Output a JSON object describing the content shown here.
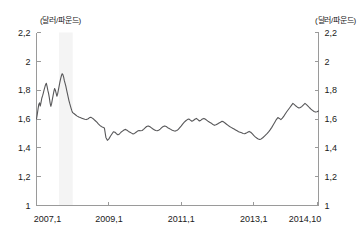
{
  "chart_data": {
    "type": "line",
    "title": "",
    "subtitle": "",
    "xlabel": "",
    "ylabel": "",
    "unit_label_left": "(달러/파운드)",
    "unit_label_right": "(달러/파운드)",
    "grid": false,
    "legend_position": "none",
    "ylim": [
      1,
      2.2
    ],
    "ytick_labels_left": [
      "2,2",
      "2",
      "1,8",
      "1,6",
      "1,4",
      "1,2",
      "1"
    ],
    "ytick_labels_right": [
      "2,2",
      "2",
      "1,8",
      "1,6",
      "1,4",
      "1,2",
      "1"
    ],
    "ytick_values": [
      2.2,
      2.0,
      1.8,
      1.6,
      1.4,
      1.2,
      1.0
    ],
    "xtick_labels": [
      "2007,1",
      "2009,1",
      "2011,1",
      "2013,1",
      "2014,10"
    ],
    "xtick_values": [
      2007.0,
      2009.0,
      2011.0,
      2013.0,
      2014.75
    ],
    "xlim": [
      2007.0,
      2014.79
    ],
    "series_color": "#58585a",
    "shaded_region": {
      "x_start": 2007.62,
      "x_end": 2008.0,
      "color": "#f4f4f4"
    },
    "x": [
      2007.0,
      2007.021,
      2007.042,
      2007.062,
      2007.083,
      2007.104,
      2007.125,
      2007.146,
      2007.167,
      2007.188,
      2007.208,
      2007.229,
      2007.25,
      2007.271,
      2007.292,
      2007.312,
      2007.333,
      2007.354,
      2007.375,
      2007.396,
      2007.417,
      2007.438,
      2007.458,
      2007.479,
      2007.5,
      2007.521,
      2007.542,
      2007.562,
      2007.583,
      2007.604,
      2007.625,
      2007.646,
      2007.667,
      2007.688,
      2007.708,
      2007.729,
      2007.75,
      2007.771,
      2007.792,
      2007.812,
      2007.833,
      2007.854,
      2007.875,
      2007.896,
      2007.917,
      2007.938,
      2007.958,
      2007.979,
      2008.0,
      2008.042,
      2008.083,
      2008.125,
      2008.167,
      2008.208,
      2008.25,
      2008.292,
      2008.333,
      2008.375,
      2008.417,
      2008.458,
      2008.5,
      2008.542,
      2008.583,
      2008.625,
      2008.667,
      2008.708,
      2008.75,
      2008.792,
      2008.833,
      2008.875,
      2008.917,
      2008.958,
      2009.0,
      2009.042,
      2009.083,
      2009.125,
      2009.167,
      2009.208,
      2009.25,
      2009.292,
      2009.333,
      2009.375,
      2009.417,
      2009.458,
      2009.5,
      2009.542,
      2009.583,
      2009.625,
      2009.667,
      2009.708,
      2009.75,
      2009.792,
      2009.833,
      2009.875,
      2009.917,
      2009.958,
      2010.0,
      2010.042,
      2010.083,
      2010.125,
      2010.167,
      2010.208,
      2010.25,
      2010.292,
      2010.333,
      2010.375,
      2010.417,
      2010.458,
      2010.5,
      2010.542,
      2010.583,
      2010.625,
      2010.667,
      2010.708,
      2010.75,
      2010.792,
      2010.833,
      2010.875,
      2010.917,
      2010.958,
      2011.0,
      2011.042,
      2011.083,
      2011.125,
      2011.167,
      2011.208,
      2011.25,
      2011.292,
      2011.333,
      2011.375,
      2011.417,
      2011.458,
      2011.5,
      2011.542,
      2011.583,
      2011.625,
      2011.667,
      2011.708,
      2011.75,
      2011.792,
      2011.833,
      2011.875,
      2011.917,
      2011.958,
      2012.0,
      2012.042,
      2012.083,
      2012.125,
      2012.167,
      2012.208,
      2012.25,
      2012.292,
      2012.333,
      2012.375,
      2012.417,
      2012.458,
      2012.5,
      2012.542,
      2012.583,
      2012.625,
      2012.667,
      2012.708,
      2012.75,
      2012.792,
      2012.833,
      2012.875,
      2012.917,
      2012.958,
      2013.0,
      2013.042,
      2013.083,
      2013.125,
      2013.167,
      2013.208,
      2013.25,
      2013.292,
      2013.333,
      2013.375,
      2013.417,
      2013.458,
      2013.5,
      2013.542,
      2013.583,
      2013.625,
      2013.667,
      2013.708,
      2013.75,
      2013.792,
      2013.833,
      2013.875,
      2013.917,
      2013.958,
      2014.0,
      2014.042,
      2014.083,
      2014.125,
      2014.167,
      2014.208,
      2014.25,
      2014.292,
      2014.333,
      2014.375,
      2014.417,
      2014.458,
      2014.5,
      2014.542,
      2014.583,
      2014.625,
      2014.667,
      2014.708,
      2014.75,
      2014.79
    ],
    "y": [
      1.6,
      1.632,
      1.668,
      1.7,
      1.712,
      1.69,
      1.716,
      1.744,
      1.76,
      1.78,
      1.8,
      1.82,
      1.838,
      1.848,
      1.826,
      1.8,
      1.778,
      1.748,
      1.712,
      1.688,
      1.706,
      1.736,
      1.762,
      1.79,
      1.812,
      1.8,
      1.78,
      1.758,
      1.772,
      1.8,
      1.828,
      1.856,
      1.88,
      1.9,
      1.914,
      1.908,
      1.89,
      1.864,
      1.846,
      1.826,
      1.8,
      1.776,
      1.752,
      1.728,
      1.708,
      1.69,
      1.672,
      1.656,
      1.644,
      1.636,
      1.628,
      1.62,
      1.614,
      1.61,
      1.606,
      1.602,
      1.598,
      1.596,
      1.6,
      1.608,
      1.612,
      1.606,
      1.598,
      1.588,
      1.578,
      1.566,
      1.556,
      1.548,
      1.542,
      1.538,
      1.472,
      1.452,
      1.462,
      1.48,
      1.496,
      1.512,
      1.508,
      1.498,
      1.49,
      1.496,
      1.508,
      1.516,
      1.524,
      1.528,
      1.522,
      1.514,
      1.508,
      1.502,
      1.496,
      1.5,
      1.508,
      1.516,
      1.52,
      1.518,
      1.52,
      1.528,
      1.538,
      1.548,
      1.552,
      1.548,
      1.54,
      1.532,
      1.526,
      1.52,
      1.518,
      1.522,
      1.53,
      1.54,
      1.548,
      1.552,
      1.548,
      1.54,
      1.534,
      1.528,
      1.522,
      1.518,
      1.516,
      1.52,
      1.528,
      1.54,
      1.552,
      1.566,
      1.578,
      1.588,
      1.596,
      1.6,
      1.592,
      1.584,
      1.59,
      1.598,
      1.604,
      1.596,
      1.586,
      1.592,
      1.6,
      1.604,
      1.598,
      1.59,
      1.582,
      1.576,
      1.57,
      1.562,
      1.556,
      1.56,
      1.566,
      1.572,
      1.578,
      1.584,
      1.58,
      1.572,
      1.564,
      1.556,
      1.548,
      1.542,
      1.536,
      1.53,
      1.524,
      1.518,
      1.512,
      1.508,
      1.504,
      1.5,
      1.498,
      1.502,
      1.508,
      1.514,
      1.508,
      1.498,
      1.486,
      1.476,
      1.468,
      1.462,
      1.458,
      1.462,
      1.47,
      1.48,
      1.49,
      1.5,
      1.512,
      1.526,
      1.542,
      1.56,
      1.578,
      1.596,
      1.61,
      1.604,
      1.596,
      1.606,
      1.62,
      1.636,
      1.652,
      1.666,
      1.68,
      1.694,
      1.708,
      1.7,
      1.69,
      1.682,
      1.676,
      1.68,
      1.688,
      1.698,
      1.708,
      1.7,
      1.69,
      1.678,
      1.668,
      1.66,
      1.652,
      1.648,
      1.65,
      1.656,
      1.664,
      1.672
    ]
  }
}
